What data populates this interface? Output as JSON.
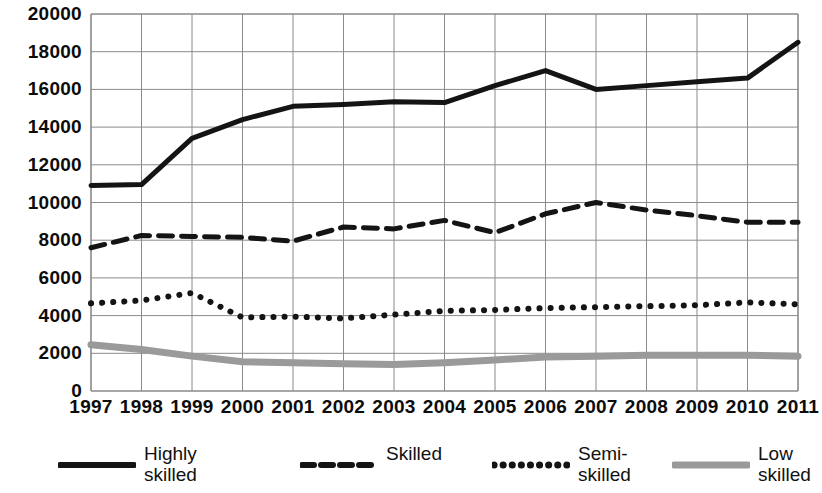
{
  "chart_data": {
    "type": "line",
    "title": "",
    "xlabel": "",
    "ylabel": "",
    "grid": true,
    "legend_position": "bottom",
    "x": [
      1997,
      1998,
      1999,
      2000,
      2001,
      2002,
      2003,
      2004,
      2005,
      2006,
      2007,
      2008,
      2009,
      2010,
      2011
    ],
    "xticklabels": [
      "1997",
      "1998",
      "1999",
      "2000",
      "2001",
      "2002",
      "2003",
      "2004",
      "2005",
      "2006",
      "2007",
      "2008",
      "2009",
      "2010",
      "2011"
    ],
    "ylim": [
      0,
      20000
    ],
    "yticks": [
      0,
      2000,
      4000,
      6000,
      8000,
      10000,
      12000,
      14000,
      16000,
      18000,
      20000
    ],
    "yticklabels": [
      "0",
      "2000",
      "4000",
      "6000",
      "8000",
      "10000",
      "12000",
      "14000",
      "16000",
      "18000",
      "20000"
    ],
    "series": [
      {
        "name": "Highly\nskilled",
        "legend_label": "Highly\nskilled",
        "style": "solid",
        "color": "#141414",
        "width": 5,
        "values": [
          10900,
          10950,
          13400,
          14400,
          15100,
          15200,
          15350,
          15300,
          16200,
          17000,
          16000,
          16200,
          16400,
          16600,
          18500
        ]
      },
      {
        "name": "Skilled",
        "legend_label": "Skilled",
        "style": "dashed",
        "color": "#141414",
        "width": 5,
        "values": [
          7600,
          8250,
          8200,
          8150,
          7950,
          8700,
          8600,
          9050,
          8400,
          9400,
          10000,
          9600,
          9300,
          8950,
          8950
        ]
      },
      {
        "name": "Semi-\nskilled",
        "legend_label": "Semi-\nskilled",
        "style": "dotted",
        "color": "#141414",
        "width": 6,
        "values": [
          4650,
          4800,
          5200,
          3900,
          3950,
          3850,
          4050,
          4250,
          4300,
          4400,
          4450,
          4500,
          4550,
          4700,
          4600
        ]
      },
      {
        "name": "Low\nskilled",
        "legend_label": "Low\nskilled",
        "style": "solid",
        "color": "#9a9a9a",
        "width": 7,
        "values": [
          2450,
          2200,
          1850,
          1550,
          1500,
          1450,
          1400,
          1500,
          1650,
          1800,
          1850,
          1900,
          1900,
          1900,
          1850
        ]
      }
    ]
  },
  "legend": {
    "entries": [
      {
        "label": "Highly\nskilled",
        "style": "solid",
        "color": "#141414"
      },
      {
        "label": "Skilled",
        "style": "dashed",
        "color": "#141414"
      },
      {
        "label": "Semi-\nskilled",
        "style": "dotted",
        "color": "#141414"
      },
      {
        "label": "Low\nskilled",
        "style": "solid",
        "color": "#9a9a9a"
      }
    ]
  }
}
